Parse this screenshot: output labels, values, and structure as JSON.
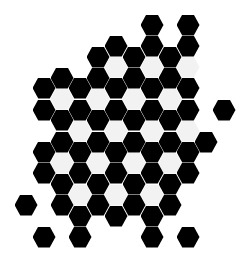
{
  "title": "Hexagon tile pattern",
  "colors": {
    "background": "#ffffff",
    "dark": "#000000",
    "light": "#f2f2f2"
  },
  "grid": {
    "origin_x": 152,
    "origin_y": 25,
    "col_spacing": 18,
    "row_spacing": 21.2,
    "hex_width": 23,
    "hex_height": 21
  },
  "cells": [
    {
      "x": 152,
      "y": 25,
      "c": "dark"
    },
    {
      "x": 188,
      "y": 25,
      "c": "dark"
    },
    {
      "x": 116,
      "y": 46,
      "c": "dark"
    },
    {
      "x": 152,
      "y": 46,
      "c": "dark"
    },
    {
      "x": 188,
      "y": 46,
      "c": "dark"
    },
    {
      "x": 98,
      "y": 57,
      "c": "dark"
    },
    {
      "x": 134,
      "y": 57,
      "c": "dark"
    },
    {
      "x": 170,
      "y": 57,
      "c": "dark"
    },
    {
      "x": 116,
      "y": 67,
      "c": "light"
    },
    {
      "x": 152,
      "y": 67,
      "c": "light"
    },
    {
      "x": 188,
      "y": 67,
      "c": "light"
    },
    {
      "x": 62,
      "y": 78,
      "c": "dark"
    },
    {
      "x": 98,
      "y": 78,
      "c": "dark"
    },
    {
      "x": 134,
      "y": 78,
      "c": "dark"
    },
    {
      "x": 170,
      "y": 78,
      "c": "dark"
    },
    {
      "x": 44,
      "y": 88,
      "c": "dark"
    },
    {
      "x": 80,
      "y": 88,
      "c": "dark"
    },
    {
      "x": 116,
      "y": 88,
      "c": "dark"
    },
    {
      "x": 152,
      "y": 88,
      "c": "dark"
    },
    {
      "x": 188,
      "y": 88,
      "c": "dark"
    },
    {
      "x": 62,
      "y": 99,
      "c": "light"
    },
    {
      "x": 98,
      "y": 99,
      "c": "light"
    },
    {
      "x": 134,
      "y": 99,
      "c": "light"
    },
    {
      "x": 170,
      "y": 99,
      "c": "light"
    },
    {
      "x": 44,
      "y": 110,
      "c": "dark"
    },
    {
      "x": 80,
      "y": 110,
      "c": "dark"
    },
    {
      "x": 116,
      "y": 110,
      "c": "dark"
    },
    {
      "x": 152,
      "y": 110,
      "c": "dark"
    },
    {
      "x": 188,
      "y": 110,
      "c": "dark"
    },
    {
      "x": 224,
      "y": 110,
      "c": "dark"
    },
    {
      "x": 62,
      "y": 120,
      "c": "dark"
    },
    {
      "x": 98,
      "y": 120,
      "c": "dark"
    },
    {
      "x": 134,
      "y": 120,
      "c": "dark"
    },
    {
      "x": 170,
      "y": 120,
      "c": "dark"
    },
    {
      "x": 80,
      "y": 131,
      "c": "light"
    },
    {
      "x": 116,
      "y": 131,
      "c": "light"
    },
    {
      "x": 152,
      "y": 131,
      "c": "light"
    },
    {
      "x": 188,
      "y": 131,
      "c": "light"
    },
    {
      "x": 62,
      "y": 142,
      "c": "dark"
    },
    {
      "x": 98,
      "y": 142,
      "c": "dark"
    },
    {
      "x": 134,
      "y": 142,
      "c": "dark"
    },
    {
      "x": 170,
      "y": 142,
      "c": "dark"
    },
    {
      "x": 206,
      "y": 142,
      "c": "dark"
    },
    {
      "x": 44,
      "y": 152,
      "c": "dark"
    },
    {
      "x": 80,
      "y": 152,
      "c": "dark"
    },
    {
      "x": 116,
      "y": 152,
      "c": "dark"
    },
    {
      "x": 152,
      "y": 152,
      "c": "dark"
    },
    {
      "x": 188,
      "y": 152,
      "c": "dark"
    },
    {
      "x": 62,
      "y": 163,
      "c": "light"
    },
    {
      "x": 98,
      "y": 163,
      "c": "light"
    },
    {
      "x": 134,
      "y": 163,
      "c": "light"
    },
    {
      "x": 170,
      "y": 163,
      "c": "light"
    },
    {
      "x": 44,
      "y": 173,
      "c": "dark"
    },
    {
      "x": 80,
      "y": 173,
      "c": "dark"
    },
    {
      "x": 116,
      "y": 173,
      "c": "dark"
    },
    {
      "x": 152,
      "y": 173,
      "c": "dark"
    },
    {
      "x": 188,
      "y": 173,
      "c": "dark"
    },
    {
      "x": 62,
      "y": 184,
      "c": "dark"
    },
    {
      "x": 98,
      "y": 184,
      "c": "dark"
    },
    {
      "x": 134,
      "y": 184,
      "c": "dark"
    },
    {
      "x": 170,
      "y": 184,
      "c": "dark"
    },
    {
      "x": 80,
      "y": 195,
      "c": "light"
    },
    {
      "x": 116,
      "y": 195,
      "c": "light"
    },
    {
      "x": 152,
      "y": 195,
      "c": "light"
    },
    {
      "x": 26,
      "y": 205,
      "c": "dark"
    },
    {
      "x": 62,
      "y": 205,
      "c": "dark"
    },
    {
      "x": 98,
      "y": 205,
      "c": "dark"
    },
    {
      "x": 134,
      "y": 205,
      "c": "dark"
    },
    {
      "x": 170,
      "y": 205,
      "c": "dark"
    },
    {
      "x": 80,
      "y": 216,
      "c": "dark"
    },
    {
      "x": 116,
      "y": 216,
      "c": "dark"
    },
    {
      "x": 152,
      "y": 216,
      "c": "dark"
    },
    {
      "x": 44,
      "y": 237,
      "c": "dark"
    },
    {
      "x": 80,
      "y": 237,
      "c": "dark"
    },
    {
      "x": 152,
      "y": 237,
      "c": "dark"
    },
    {
      "x": 188,
      "y": 237,
      "c": "dark"
    }
  ]
}
